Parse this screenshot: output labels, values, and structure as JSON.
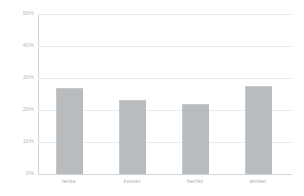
{
  "chart_data": {
    "type": "bar",
    "title": "",
    "subtitle": "",
    "xlabel": "",
    "ylabel": "",
    "categories": [
      "lente",
      "zomer",
      "herfst",
      "winter"
    ],
    "values": [
      27,
      23,
      22,
      27.5
    ],
    "value_suffix": "%",
    "ylim": [
      0,
      50
    ],
    "ytick_values": [
      0,
      10,
      20,
      30,
      40,
      50
    ],
    "ytick_labels": [
      "0%",
      "10%",
      "20%",
      "30%",
      "40%",
      "50%"
    ],
    "grid": true,
    "legend": false,
    "legend_position": "none",
    "series": [
      {
        "name": "",
        "values": [
          27,
          23,
          22,
          27.5
        ]
      }
    ],
    "colors": {
      "bar_fill": "#b8bcbf",
      "bar_edge": "#c5c9cb",
      "gridline": "#e9ebec",
      "axis_line": "#d2d5d7",
      "tick_text": "#b4b8bb",
      "category_text": "#a9adb0",
      "background": "#ffffff"
    }
  }
}
